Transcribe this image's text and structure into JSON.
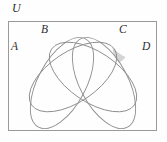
{
  "figure": {
    "kind": "venn-diagram",
    "set_count": 4,
    "background_color": "#fefefe",
    "stroke_color": "#8e8e8e",
    "shade_color": "#d4d4d4",
    "rect_stroke_color": "#9a9a9a",
    "labels": {
      "universe": "U",
      "set_a": "A",
      "set_b": "B",
      "set_c": "C",
      "set_d": "D"
    },
    "universe_rect": {
      "x": 8,
      "y": 21,
      "width": 149,
      "height": 110
    },
    "ellipses": [
      {
        "name": "A",
        "cx": 62,
        "cy": 83,
        "rx": 50,
        "ry": 24,
        "rotation_deg": -62
      },
      {
        "name": "B",
        "cx": 73,
        "cy": 77,
        "rx": 50,
        "ry": 25,
        "rotation_deg": -34
      },
      {
        "name": "C",
        "cx": 93,
        "cy": 77,
        "rx": 50,
        "ry": 25,
        "rotation_deg": 34
      },
      {
        "name": "D",
        "cx": 104,
        "cy": 83,
        "rx": 50,
        "ry": 24,
        "rotation_deg": 62
      }
    ],
    "shaded_region": {
      "name": "shaded-region-C-D",
      "fill": "#d4d4d4",
      "path": "M 112.5 47.5 C 116.5 51.5 121.5 55.5 125.5 57.0 C 124.0 59.5 121.0 62.0 118.5 62.5 C 115.0 58.0 112.5 52.5 112.5 47.5 Z"
    }
  }
}
